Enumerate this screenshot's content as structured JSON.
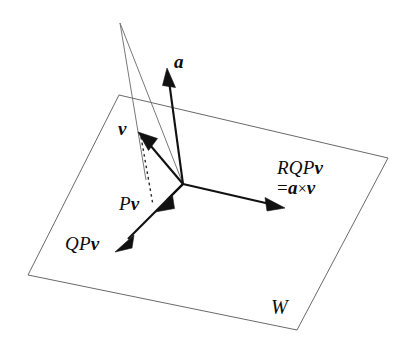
{
  "figure": {
    "kind": "vector-geometry-diagram",
    "background_color": "#ffffff",
    "stroke_color": "#111111",
    "plane_edge_color": "#6a6a6a"
  },
  "labels": {
    "a": "a",
    "v": "v",
    "pv_operator": "P",
    "pv_vector": "v",
    "qpv_operator": "QP",
    "qpv_vector": "v",
    "rqpv_line1_operator": "RQP",
    "rqpv_line1_vector": "v",
    "rqpv_eq": "=",
    "rqpv_a": "a",
    "rqpv_times": "×",
    "rqpv_v": "v",
    "plane": "W"
  },
  "geometry": {
    "origin": [
      183,
      184
    ],
    "plane_corners": [
      [
        119,
        95
      ],
      [
        388,
        158
      ],
      [
        297,
        330
      ],
      [
        28,
        275
      ]
    ],
    "wall_apex": [
      120,
      23
    ],
    "vectors": [
      {
        "name": "a",
        "from": [
          183,
          184
        ],
        "to": [
          167,
          70
        ],
        "style": "solid"
      },
      {
        "name": "v",
        "from": [
          183,
          184
        ],
        "to": [
          140,
          133
        ],
        "style": "solid"
      },
      {
        "name": "Pv",
        "from": [
          183,
          184
        ],
        "to": [
          157,
          210
        ],
        "style": "solid"
      },
      {
        "name": "QPv",
        "from": [
          183,
          184
        ],
        "to": [
          117,
          250
        ],
        "style": "solid"
      },
      {
        "name": "RQPv",
        "from": [
          183,
          184
        ],
        "to": [
          283,
          207
        ],
        "style": "solid"
      }
    ],
    "dashed_segments": [
      {
        "name": "v-to-Pv-drop",
        "from": [
          140,
          135
        ],
        "to": [
          152,
          206
        ]
      }
    ]
  }
}
